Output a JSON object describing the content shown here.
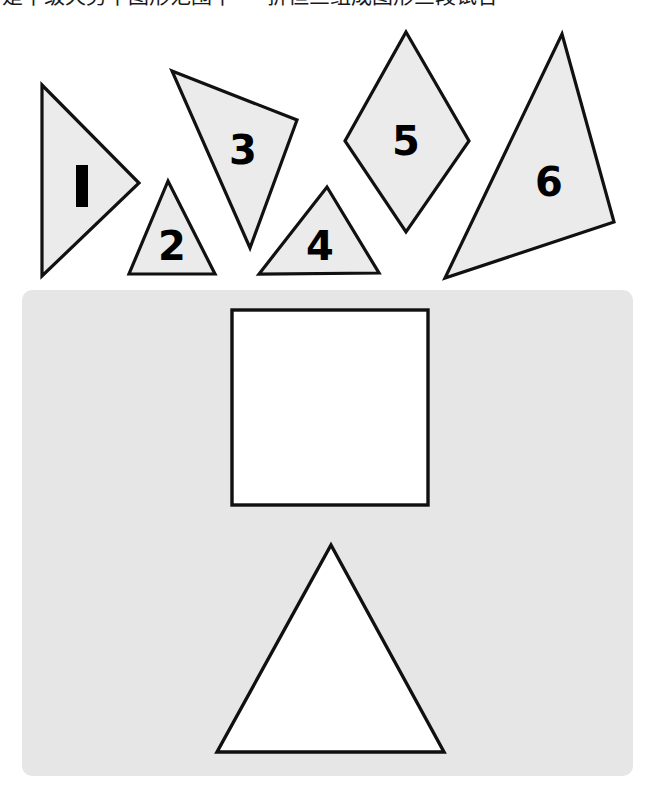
{
  "page": {
    "title_text_clipped": "是中级天势中图形范围中 — 折但三组成图形三段试合",
    "background_color": "#ffffff"
  },
  "colors": {
    "piece_fill": "#ebebeb",
    "piece_outline": "#111111",
    "panel_fill": "#e6e6e6",
    "target_fill": "#ffffff",
    "target_outline": "#101010",
    "label_color": "#000000"
  },
  "pieces_tray": {
    "name": "shape-pieces-tray",
    "count": 6,
    "pieces": [
      {
        "id": "piece-1",
        "label": "1",
        "type": "triangle",
        "label_style": "bar",
        "points": "42,85 42,276 139,183",
        "label_x": 82,
        "label_y": 186
      },
      {
        "id": "piece-2",
        "label": "2",
        "type": "triangle",
        "label_style": "glyph",
        "points": "168,181 129,274 215,274",
        "label_x": 172,
        "label_y": 249
      },
      {
        "id": "piece-3",
        "label": "3",
        "type": "triangle",
        "label_style": "glyph",
        "points": "172,71 297,120 250,248",
        "label_x": 243,
        "label_y": 153
      },
      {
        "id": "piece-4",
        "label": "4",
        "type": "triangle",
        "label_style": "glyph",
        "points": "327,187 259,274 379,273",
        "label_x": 320,
        "label_y": 249
      },
      {
        "id": "piece-5",
        "label": "5",
        "type": "rhombus",
        "label_style": "glyph",
        "points": "406,32 469,141 406,232 345,141",
        "label_x": 406,
        "label_y": 144
      },
      {
        "id": "piece-6",
        "label": "6",
        "type": "triangle",
        "label_style": "glyph",
        "points": "562,34 614,222 445,278",
        "label_x": 549,
        "label_y": 185
      }
    ]
  },
  "target_panel": {
    "name": "target-outline-panel",
    "rect": {
      "x": 22,
      "y": 290,
      "width": 611,
      "height": 486,
      "radius": 10
    },
    "targets": [
      {
        "id": "target-square",
        "type": "square",
        "rect": {
          "x": 232,
          "y": 310,
          "width": 196,
          "height": 195
        }
      },
      {
        "id": "target-triangle",
        "type": "triangle",
        "points": "331,545 444,752 217,752"
      }
    ]
  }
}
